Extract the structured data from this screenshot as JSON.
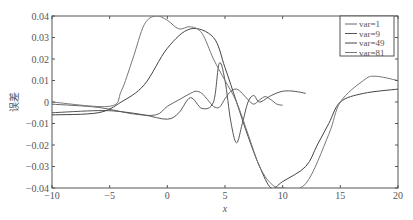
{
  "chart_data": {
    "type": "line",
    "title": "",
    "xlabel": "x",
    "ylabel": "误差",
    "xlim": [
      -10,
      20
    ],
    "ylim": [
      -0.04,
      0.04
    ],
    "xticks": [
      "-10",
      "-5",
      "0",
      "5",
      "10",
      "15",
      "20"
    ],
    "yticks": [
      "0.04",
      "0.03",
      "0.02",
      "0.01",
      "0",
      "-0.01",
      "-0.02",
      "-0.03",
      "-0.04"
    ],
    "grid": false,
    "legend_position": "upper right",
    "series": [
      {
        "name": "var=1",
        "x": [
          -10,
          -6,
          -3,
          -1,
          0,
          1,
          2,
          2.5,
          3,
          3.5,
          4,
          4.5,
          5,
          5.5,
          6,
          6.5,
          7,
          7.5,
          8,
          8.5,
          9,
          9.5,
          10
        ],
        "y": [
          -0.001,
          -0.0025,
          -0.0055,
          -0.006,
          -0.002,
          0.001,
          0.004,
          0.005,
          0.004,
          0.001,
          -0.002,
          -0.0025,
          0.0015,
          0.005,
          0.006,
          0.004,
          0.001,
          -0.001,
          0.001,
          0.0025,
          0.001,
          -0.001,
          -0.0015
        ]
      },
      {
        "name": "var=9",
        "x": [
          -10,
          -6,
          -4,
          -2,
          0,
          1,
          2,
          3,
          4,
          4.5,
          5,
          5.5,
          6,
          6.5,
          7,
          7.5,
          8,
          9,
          10,
          11,
          12
        ],
        "y": [
          -0.005,
          -0.004,
          -0.0045,
          -0.006,
          -0.008,
          -0.005,
          0.002,
          -0.003,
          0.0,
          0.018,
          0.01,
          -0.009,
          -0.019,
          -0.01,
          0.0,
          0.003,
          0.0,
          0.003,
          0.005,
          0.005,
          0.004
        ]
      },
      {
        "name": "var=49",
        "x": [
          -10,
          -6,
          -4,
          -2,
          0,
          2,
          4,
          5,
          6,
          7,
          8,
          9,
          10,
          12,
          13,
          14,
          15,
          17,
          20
        ],
        "y": [
          -0.006,
          -0.005,
          0.0,
          0.008,
          0.025,
          0.034,
          0.03,
          0.016,
          0.0,
          -0.016,
          -0.03,
          -0.04,
          -0.037,
          -0.03,
          -0.02,
          -0.01,
          0.0,
          0.004,
          0.006
        ]
      },
      {
        "name": "var=81",
        "x": [
          -10,
          -5,
          -4,
          -3,
          -2,
          -1,
          0,
          1,
          2,
          3,
          4,
          5,
          6,
          7,
          8,
          9,
          10,
          12,
          14,
          15,
          17,
          18,
          20
        ],
        "y": [
          0.0,
          -0.002,
          0.005,
          0.02,
          0.036,
          0.04,
          0.038,
          0.034,
          0.035,
          0.032,
          0.02,
          0.01,
          0.0,
          -0.015,
          -0.03,
          -0.038,
          -0.04,
          -0.038,
          -0.015,
          0.0,
          0.01,
          0.012,
          0.01
        ]
      }
    ]
  },
  "labels": {
    "ylabel": "误差",
    "xlabel": "x"
  }
}
